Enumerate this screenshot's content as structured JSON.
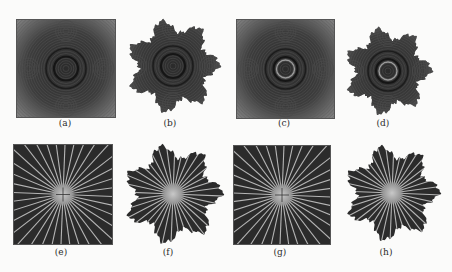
{
  "figure": {
    "panels": [
      {
        "id": "a",
        "caption": "(a)",
        "shape": "square",
        "pattern": "rings"
      },
      {
        "id": "b",
        "caption": "(b)",
        "shape": "fractal",
        "pattern": "rings"
      },
      {
        "id": "c",
        "caption": "(c)",
        "shape": "square",
        "pattern": "rings"
      },
      {
        "id": "d",
        "caption": "(d)",
        "shape": "fractal",
        "pattern": "rings"
      },
      {
        "id": "e",
        "caption": "(e)",
        "shape": "square",
        "pattern": "rays"
      },
      {
        "id": "f",
        "caption": "(f)",
        "shape": "fractal",
        "pattern": "rays"
      },
      {
        "id": "g",
        "caption": "(g)",
        "shape": "square",
        "pattern": "rays"
      },
      {
        "id": "h",
        "caption": "(h)",
        "shape": "fractal",
        "pattern": "rays"
      }
    ],
    "colors": {
      "dark": "#2b2b2b",
      "mid": "#6a6a6a",
      "light": "#a8a8a8",
      "ray": "#b5b5b5",
      "background": "#fbfbfa"
    }
  }
}
